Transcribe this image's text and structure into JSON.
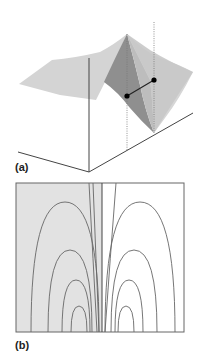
{
  "figure": {
    "panels": [
      {
        "id": "a",
        "label": "(a)",
        "kind": "3d-surface",
        "description": "Light grey surface sheet with a sharp triangular ridge; two black marked points joined by a short line, each with a dotted vertical drop line; three axes meeting at an origin below."
      },
      {
        "id": "b",
        "label": "(b)",
        "kind": "contour-map",
        "description": "Rectangular frame split by a central vertical line; left half shaded grey, right half white; nested arch-shaped contour lines on both sides rising from the bottom edge."
      }
    ],
    "colors": {
      "surface_light": "#d4d4d4",
      "surface_mid": "#bdbdbd",
      "surface_dark": "#8f8f8f",
      "surface_right_face": "#c8c8c8",
      "line": "#555555",
      "axis": "#444444",
      "dot": "#000000",
      "contour": "#666666",
      "shade_left": "#e2e2e2",
      "background": "#ffffff"
    },
    "contours": {
      "left_arches": [
        {
          "cx": 65,
          "half_width": 37,
          "top_y": 202
        },
        {
          "cx": 70,
          "half_width": 22,
          "top_y": 250
        },
        {
          "cx": 76,
          "half_width": 14,
          "top_y": 280
        },
        {
          "cx": 79,
          "half_width": 8,
          "top_y": 306
        }
      ],
      "right_arches": [
        {
          "cx": 140,
          "half_width": 37,
          "top_y": 202
        },
        {
          "cx": 134,
          "half_width": 22,
          "top_y": 250
        },
        {
          "cx": 129,
          "half_width": 14,
          "top_y": 280
        },
        {
          "cx": 126,
          "half_width": 8,
          "top_y": 306
        }
      ]
    }
  }
}
